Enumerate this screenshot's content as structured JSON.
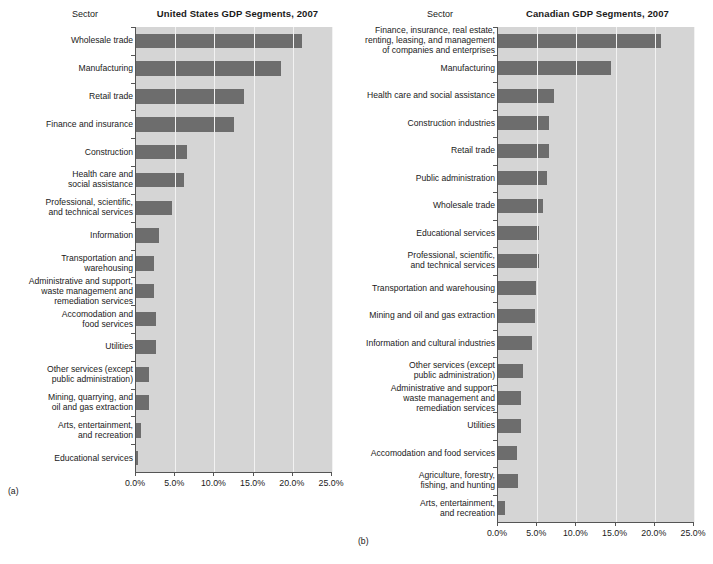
{
  "figure": {
    "panels": [
      {
        "caption": "(a)",
        "sector_header": "Sector",
        "title": "United States GDP Segments, 2007"
      },
      {
        "caption": "(b)",
        "sector_header": "Sector",
        "title": "Canadian GDP Segments, 2007"
      }
    ]
  },
  "colors": {
    "bar": "#6d6d6d",
    "plot_background": "#d5d5d5",
    "gridline": "#f2f2f2",
    "axis": "#555555",
    "text": "#1a1a1a"
  },
  "chart_data": [
    {
      "type": "bar",
      "orientation": "horizontal",
      "title": "United States GDP Segments, 2007",
      "xlabel": "",
      "ylabel": "Sector",
      "xlim": [
        0,
        25
      ],
      "xticks": [
        0,
        5,
        10,
        15,
        20,
        25
      ],
      "xtick_labels": [
        "0.0%",
        "5.0%",
        "10.0%",
        "15.0%",
        "20.0%",
        "25.0%"
      ],
      "grid": true,
      "legend": "none",
      "categories": [
        "Wholesale trade",
        "Manufacturing",
        "Retail trade",
        "Finance and insurance",
        "Construction",
        "Health care and\nsocial assistance",
        "Professional, scientific,\nand technical services",
        "Information",
        "Transportation and\nwarehousing",
        "Administrative and support,\nwaste management and\nremediation services",
        "Accomodation and\nfood services",
        "Utilities",
        "Other services (except\npublic administration)",
        "Mining, quarrying, and\noil and gas extraction",
        "Arts, entertainment,\nand recreation",
        "Educational services"
      ],
      "values": [
        21.2,
        18.5,
        13.8,
        12.5,
        6.5,
        6.1,
        4.6,
        2.9,
        2.3,
        2.3,
        2.5,
        2.5,
        1.7,
        1.7,
        0.6,
        0.1
      ]
    },
    {
      "type": "bar",
      "orientation": "horizontal",
      "title": "Canadian GDP Segments, 2007",
      "xlabel": "",
      "ylabel": "Sector",
      "xlim": [
        0,
        25
      ],
      "xticks": [
        0,
        5,
        10,
        15,
        20,
        25
      ],
      "xtick_labels": [
        "0.0%",
        "5.0%",
        "10.0%",
        "15.0%",
        "20.0%",
        "25.0%"
      ],
      "grid": true,
      "legend": "none",
      "categories": [
        "Finance, insurance, real estate,\nrenting, leasing, and management\nof companies and enterprises",
        "Manufacturing",
        "Health care and social assistance",
        "Construction industries",
        "Retail trade",
        "Public administration",
        "Wholesale trade",
        "Educational services",
        "Professional, scientific,\nand technical services",
        "Transportation and warehousing",
        "Mining and oil and gas extraction",
        "Information and cultural industries",
        "Other services (except\npublic administration)",
        "Administrative and support,\nwaste management and\nremediation services",
        "Utilities",
        "Accomodation and food services",
        "Agriculture, forestry,\nfishing, and hunting",
        "Arts, entertainment,\nand recreation"
      ],
      "values": [
        20.8,
        14.4,
        7.1,
        6.5,
        6.5,
        6.2,
        5.7,
        5.2,
        5.2,
        4.8,
        4.7,
        4.3,
        3.2,
        2.9,
        2.9,
        2.4,
        2.5,
        0.9
      ]
    }
  ]
}
